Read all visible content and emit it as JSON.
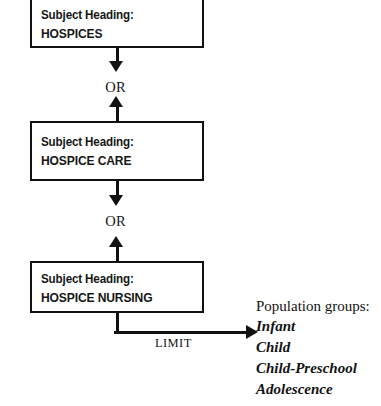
{
  "diagram": {
    "type": "flowchart",
    "nodes": [
      {
        "id": "hospices",
        "label": "Subject Heading:",
        "term": "HOSPICES"
      },
      {
        "id": "hospice-care",
        "label": "Subject Heading:",
        "term": "HOSPICE CARE"
      },
      {
        "id": "hospice-nursing",
        "label": "Subject Heading:",
        "term": "HOSPICE NURSING"
      }
    ],
    "connectors": [
      {
        "id": "or-1",
        "label": "OR",
        "from": "hospices",
        "to": "hospice-care",
        "direction": "bidirectional"
      },
      {
        "id": "or-2",
        "label": "OR",
        "from": "hospice-care",
        "to": "hospice-nursing",
        "direction": "bidirectional"
      },
      {
        "id": "limit",
        "label": "LIMIT",
        "from": "hospice-nursing",
        "to": "population-groups",
        "direction": "right"
      }
    ],
    "population_groups": {
      "heading": "Population groups:",
      "items": [
        "Infant",
        "Child",
        "Child-Preschool",
        "Adolescence"
      ]
    },
    "colors": {
      "background": "#ffffff",
      "stroke": "#111111",
      "text": "#121212"
    }
  }
}
